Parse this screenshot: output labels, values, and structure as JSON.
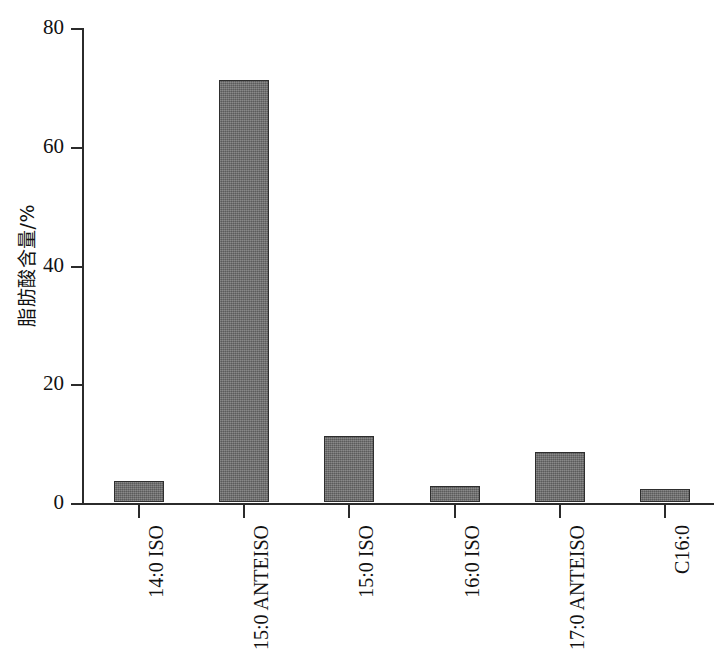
{
  "chart_data": {
    "type": "bar",
    "title": "",
    "xlabel": "",
    "ylabel": "脂肪酸含量/%",
    "categories": [
      "14:0 ISO",
      "15:0 ANTEISO",
      "15:0 ISO",
      "16:0 ISO",
      "17:0 ANTEISO",
      "C16:0"
    ],
    "values": [
      3.5,
      71.0,
      11.2,
      2.7,
      8.5,
      2.2
    ],
    "ylim": [
      0,
      80
    ],
    "yticks": [
      0,
      20,
      40,
      60,
      80
    ],
    "ytick_labels": [
      "0",
      "20",
      "40",
      "60",
      "80"
    ],
    "grid": false,
    "legend": null,
    "bar_color": "#6f6f6f",
    "bar_edge_color": "#2e2e2e",
    "axis_color": "#2b2b2b",
    "background": "#ffffff"
  }
}
